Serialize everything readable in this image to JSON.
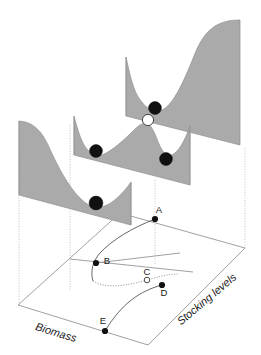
{
  "figure": {
    "kind": "stability-landscape-diagram",
    "title": "",
    "background_color": "#ffffff",
    "surface_color": "#aaaaaa",
    "stable_ball_color": "#111111",
    "unstable_ball_color": "#ffffff",
    "outline_color": "#8f8f8f"
  },
  "axes": {
    "x_label": "Biomass",
    "z_label": "Stocking levels"
  },
  "panels": [
    {
      "name": "front-panel",
      "stocking_level": "low",
      "valleys": 1,
      "hills": 0,
      "balls": [
        {
          "id": "front-ball",
          "type": "stable",
          "state": "high-biomass"
        }
      ]
    },
    {
      "name": "middle-panel",
      "stocking_level": "intermediate",
      "valleys": 2,
      "hills": 1,
      "balls": [
        {
          "id": "middle-ball-left",
          "type": "stable",
          "state": "high-biomass"
        },
        {
          "id": "middle-ball-top",
          "type": "unstable",
          "state": "threshold"
        },
        {
          "id": "middle-ball-right",
          "type": "stable",
          "state": "low-biomass"
        }
      ]
    },
    {
      "name": "back-panel",
      "stocking_level": "high",
      "valleys": 1,
      "hills": 0,
      "balls": [
        {
          "id": "back-ball",
          "type": "stable",
          "state": "low-biomass"
        }
      ]
    }
  ],
  "fold_points": [
    {
      "id": "A",
      "label": "A",
      "type": "stable",
      "branch": "upper"
    },
    {
      "id": "B",
      "label": "B",
      "type": "stable",
      "branch": "upper"
    },
    {
      "id": "C",
      "label": "C",
      "type": "unstable",
      "branch": "middle"
    },
    {
      "id": "D",
      "label": "D",
      "type": "stable",
      "branch": "lower"
    },
    {
      "id": "E",
      "label": "E",
      "type": "stable",
      "branch": "lower"
    }
  ]
}
